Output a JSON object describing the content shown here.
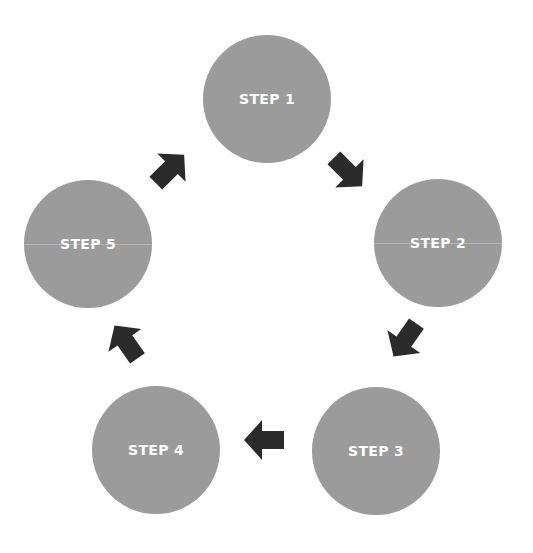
{
  "diagram": {
    "type": "cycle",
    "colors": {
      "circle_fill": "#9b9b9b",
      "label_text": "#ffffff",
      "arrow_fill": "#2b2b2b",
      "background": "#ffffff"
    },
    "steps": [
      {
        "label": "STEP 1"
      },
      {
        "label": "STEP 2"
      },
      {
        "label": "STEP 3"
      },
      {
        "label": "STEP 4"
      },
      {
        "label": "STEP 5"
      }
    ],
    "arrows": [
      {
        "from": "STEP 1",
        "to": "STEP 2",
        "direction": "down-right"
      },
      {
        "from": "STEP 2",
        "to": "STEP 3",
        "direction": "down-left"
      },
      {
        "from": "STEP 3",
        "to": "STEP 4",
        "direction": "left"
      },
      {
        "from": "STEP 4",
        "to": "STEP 5",
        "direction": "up-left"
      },
      {
        "from": "STEP 5",
        "to": "STEP 1",
        "direction": "up-right"
      }
    ]
  }
}
